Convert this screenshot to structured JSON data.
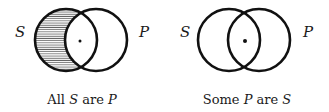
{
  "diagrams": [
    {
      "set_left": "S",
      "set_right": "P",
      "caption": {
        "w1": "All",
        "v1": "S",
        "w2": "are",
        "v2": "P"
      },
      "shaded_region": "S only",
      "marked_region": "S and P"
    },
    {
      "set_left": "S",
      "set_right": "P",
      "caption": {
        "w1": "Some",
        "v1": "P",
        "w2": "are",
        "v2": "S"
      },
      "shaded_region": "none",
      "marked_region": "S and P"
    }
  ],
  "colors": {
    "stroke": "#111111",
    "hatch": "#555555"
  }
}
